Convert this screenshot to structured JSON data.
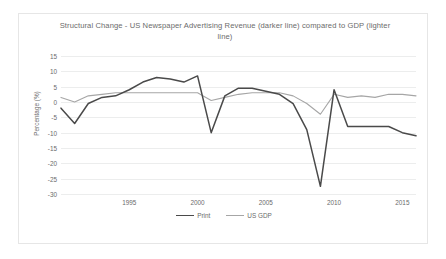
{
  "chart_data": {
    "type": "line",
    "title": "Structural Change - US Newspaper Advertising Revenue (darker line) compared to GDP (lighter line)",
    "xlabel": "",
    "ylabel": "Percentage (%)",
    "ylim": [
      -30,
      15
    ],
    "xlim": [
      1990,
      2016
    ],
    "grid": true,
    "legend_position": "bottom",
    "y_ticks": [
      15,
      10,
      5,
      0,
      -5,
      -10,
      -15,
      -20,
      -25,
      -30
    ],
    "y_tick_labels": [
      "15",
      "10",
      "5",
      "0",
      "-5",
      "-10",
      "-15",
      "-20",
      "-25",
      "-30"
    ],
    "x_ticks": [
      1995,
      2000,
      2005,
      2010,
      2015
    ],
    "x_tick_labels": [
      "1995",
      "2000",
      "2005",
      "2010",
      "2015"
    ],
    "x": [
      1990,
      1991,
      1992,
      1993,
      1994,
      1995,
      1996,
      1997,
      1998,
      1999,
      2000,
      2001,
      2002,
      2003,
      2004,
      2005,
      2006,
      2007,
      2008,
      2009,
      2010,
      2011,
      2012,
      2013,
      2014,
      2015,
      2016
    ],
    "series": [
      {
        "name": "Print",
        "color": "#4a4a4a",
        "values": [
          -2.0,
          -7.0,
          -0.5,
          1.5,
          2.0,
          4.0,
          6.5,
          8.0,
          7.5,
          6.5,
          8.5,
          -10.0,
          2.0,
          4.5,
          4.5,
          3.5,
          2.5,
          -0.5,
          -9.0,
          -27.5,
          4.0,
          -8.0,
          -8.0,
          -8.0,
          -8.0,
          -10.0,
          -11.0
        ]
      },
      {
        "name": "US GDP",
        "color": "#a6a6a6",
        "values": [
          1.5,
          0.0,
          2.0,
          2.5,
          3.0,
          3.0,
          3.0,
          3.0,
          3.0,
          3.0,
          3.0,
          0.5,
          1.5,
          2.5,
          3.0,
          3.0,
          3.0,
          2.0,
          -0.5,
          -4.0,
          2.5,
          1.5,
          2.0,
          1.5,
          2.5,
          2.5,
          2.0
        ]
      }
    ],
    "legend": [
      {
        "label": "Print",
        "color": "#4a4a4a"
      },
      {
        "label": "US GDP",
        "color": "#a6a6a6"
      }
    ]
  }
}
